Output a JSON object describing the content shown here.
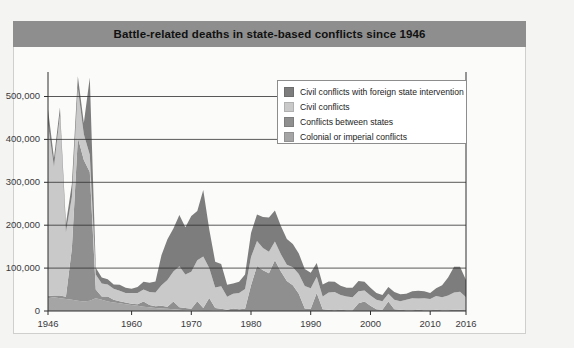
{
  "panel": {
    "title": "Battle-related deaths in state-based conflicts since 1946",
    "title_bar_color": "#8e8e8e",
    "background_color": "#fbfbfa",
    "border_color": "#cfcfcd"
  },
  "legend": {
    "position": "inside-top-right",
    "items": [
      {
        "label": "Civil conflicts with foreign state intervention",
        "color": "#7d7d7d"
      },
      {
        "label": "Civil conflicts",
        "color": "#c9c9c9"
      },
      {
        "label": "Conflicts between states",
        "color": "#8f8f8f"
      },
      {
        "label": "Colonial or imperial conflicts",
        "color": "#a5a5a5"
      }
    ]
  },
  "axes": {
    "y_ticks": [
      "0",
      "100,000",
      "200,000",
      "300,000",
      "400,000",
      "500,000"
    ],
    "x_ticks": [
      "1946",
      "1960",
      "1970",
      "1980",
      "1990",
      "2000",
      "2010",
      "2016"
    ],
    "y_label": "",
    "x_label": ""
  },
  "chart_data": {
    "type": "area",
    "stacked": true,
    "title": "Battle-related deaths in state-based conflicts since 1946",
    "xlabel": "",
    "ylabel": "",
    "xlim": [
      1946,
      2016
    ],
    "ylim": [
      0,
      550000
    ],
    "ytick_values": [
      0,
      100000,
      200000,
      300000,
      400000,
      500000
    ],
    "xtick_values": [
      1946,
      1960,
      1970,
      1980,
      1990,
      2000,
      2010,
      2016
    ],
    "grid": "horizontal",
    "legend_position": "inside-top-right",
    "x": [
      1946,
      1947,
      1948,
      1949,
      1950,
      1951,
      1952,
      1953,
      1954,
      1955,
      1956,
      1957,
      1958,
      1959,
      1960,
      1961,
      1962,
      1963,
      1964,
      1965,
      1966,
      1967,
      1968,
      1969,
      1970,
      1971,
      1972,
      1973,
      1974,
      1975,
      1976,
      1977,
      1978,
      1979,
      1980,
      1981,
      1982,
      1983,
      1984,
      1985,
      1986,
      1987,
      1988,
      1989,
      1990,
      1991,
      1992,
      1993,
      1994,
      1995,
      1996,
      1997,
      1998,
      1999,
      2000,
      2001,
      2002,
      2003,
      2004,
      2005,
      2006,
      2007,
      2008,
      2009,
      2010,
      2011,
      2012,
      2013,
      2014,
      2015,
      2016
    ],
    "series": [
      {
        "name": "Colonial or imperial conflicts",
        "color": "#a5a5a5",
        "values": [
          30000,
          32000,
          30000,
          28000,
          26000,
          24000,
          22000,
          24000,
          30000,
          26000,
          22000,
          20000,
          18000,
          16000,
          14000,
          12000,
          10000,
          9000,
          7000,
          6000,
          5000,
          4000,
          3000,
          2000,
          1500,
          1000,
          800,
          500,
          2000,
          1500,
          0,
          0,
          0,
          0,
          0,
          0,
          0,
          0,
          0,
          0,
          0,
          0,
          0,
          0,
          0,
          0,
          0,
          0,
          0,
          0,
          0,
          0,
          0,
          0,
          0,
          0,
          0,
          0,
          0,
          0,
          0,
          0,
          0,
          0,
          0,
          0,
          0,
          0,
          0,
          0,
          0
        ]
      },
      {
        "name": "Conflicts between states",
        "color": "#8f8f8f",
        "values": [
          5000,
          4000,
          6000,
          5000,
          120000,
          380000,
          330000,
          300000,
          20000,
          8000,
          12000,
          6000,
          5000,
          4000,
          3000,
          4000,
          12000,
          5000,
          4000,
          6000,
          5000,
          18000,
          6000,
          5000,
          4000,
          22000,
          6000,
          30000,
          5000,
          4000,
          3000,
          6000,
          4000,
          5000,
          60000,
          105000,
          95000,
          88000,
          118000,
          92000,
          70000,
          60000,
          40000,
          6000,
          5000,
          42000,
          4000,
          3000,
          2000,
          3000,
          2000,
          2000,
          18000,
          22000,
          12000,
          4000,
          3000,
          22000,
          4000,
          3000,
          2000,
          2000,
          3000,
          2000,
          2000,
          3000,
          2000,
          2000,
          3000,
          3000,
          2000
        ]
      },
      {
        "name": "Civil conflicts",
        "color": "#c9c9c9",
        "values": [
          400000,
          300000,
          420000,
          150000,
          120000,
          115000,
          60000,
          40000,
          35000,
          30000,
          28000,
          26000,
          24000,
          22000,
          25000,
          26000,
          28000,
          30000,
          32000,
          48000,
          62000,
          70000,
          95000,
          78000,
          86000,
          95000,
          120000,
          70000,
          48000,
          52000,
          30000,
          34000,
          38000,
          46000,
          66000,
          58000,
          52000,
          50000,
          44000,
          40000,
          38000,
          42000,
          46000,
          52000,
          48000,
          38000,
          30000,
          40000,
          42000,
          34000,
          32000,
          30000,
          28000,
          26000,
          24000,
          22000,
          20000,
          18000,
          22000,
          20000,
          24000,
          28000,
          26000,
          28000,
          26000,
          32000,
          30000,
          34000,
          40000,
          42000,
          30000
        ]
      },
      {
        "name": "Civil conflicts with foreign state intervention",
        "color": "#7d7d7d",
        "values": [
          35000,
          20000,
          18000,
          20000,
          30000,
          28000,
          26000,
          180000,
          16000,
          14000,
          12000,
          10000,
          14000,
          12000,
          10000,
          14000,
          18000,
          22000,
          26000,
          70000,
          95000,
          100000,
          120000,
          110000,
          130000,
          115000,
          155000,
          90000,
          60000,
          52000,
          28000,
          24000,
          26000,
          34000,
          56000,
          62000,
          72000,
          80000,
          72000,
          66000,
          60000,
          54000,
          48000,
          40000,
          36000,
          32000,
          28000,
          26000,
          24000,
          22000,
          20000,
          22000,
          24000,
          20000,
          18000,
          16000,
          14000,
          16000,
          18000,
          16000,
          14000,
          16000,
          18000,
          16000,
          14000,
          18000,
          28000,
          42000,
          60000,
          58000,
          40000
        ]
      }
    ]
  }
}
